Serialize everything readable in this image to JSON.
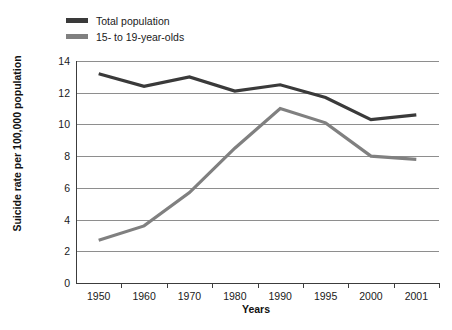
{
  "chart_data": {
    "type": "line",
    "title": "",
    "xlabel": "Years",
    "ylabel": "Suicide rate per 100,000 population",
    "categories": [
      "1950",
      "1960",
      "1970",
      "1980",
      "1990",
      "1995",
      "2000",
      "2001"
    ],
    "ylim": [
      0,
      14
    ],
    "ytick_values": [
      0,
      2,
      4,
      6,
      8,
      10,
      12,
      14
    ],
    "ytick_labels": [
      "0",
      "2",
      "4",
      "6",
      "8",
      "10",
      "12",
      "14"
    ],
    "grid": "horizontal",
    "legend_position": "top-left",
    "series": [
      {
        "name": "Total population",
        "color": "#3a3a3a",
        "values": [
          13.2,
          12.4,
          13.0,
          12.1,
          12.5,
          11.7,
          10.3,
          10.6
        ]
      },
      {
        "name": "15- to 19-year-olds",
        "color": "#808080",
        "values": [
          2.7,
          3.6,
          5.7,
          8.5,
          11.0,
          10.1,
          8.0,
          7.8
        ]
      }
    ]
  },
  "legend": {
    "items": [
      {
        "label": "Total population",
        "color": "#3a3a3a"
      },
      {
        "label": "15- to 19-year-olds",
        "color": "#808080"
      }
    ]
  },
  "axes": {
    "y_title": "Suicide rate per 100,000 population",
    "x_title": "Years"
  }
}
